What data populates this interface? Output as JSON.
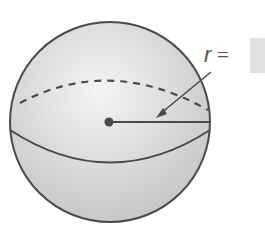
{
  "diagram": {
    "label": {
      "variable": "r",
      "equals": "="
    },
    "answer_box": {
      "value": ""
    },
    "colors": {
      "stroke": "#4a4a4a",
      "fill_light": "#f2f2f2",
      "fill_dark": "#c8c8c8",
      "answer_box": "#e2e2e2"
    }
  }
}
